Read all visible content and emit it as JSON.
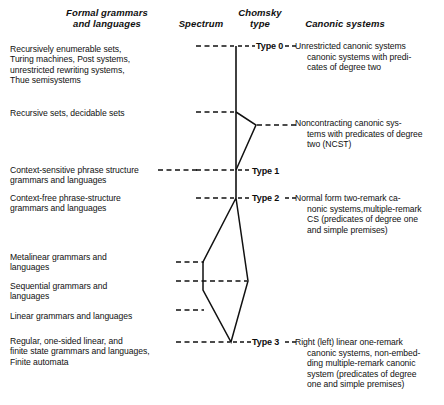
{
  "headers": {
    "formal": "Formal grammars\nand languages",
    "formal_l1": "Formal grammars",
    "formal_l2": "and languages",
    "spectrum": "Spectrum",
    "chomsky_l1": "Chomsky",
    "chomsky_l2": "type",
    "canonic": "Canonic systems"
  },
  "rows": [
    {
      "id": "type0",
      "chomsky": "Type 0",
      "left_lines": [
        "Recursively enumerable sets,",
        "Turing machines, Post systems,",
        "unrestricted rewriting systems,",
        "Thue semisystems"
      ],
      "right_lines": [
        "Unrestricted  canonic  systems",
        "canonic  systems  with  predi-",
        "cates of degree two"
      ]
    },
    {
      "id": "recursive",
      "chomsky": "",
      "left_lines": [
        "Recursive sets, decidable sets"
      ],
      "right_lines": [
        "Noncontracting  canonic  sys-",
        "tems with predicates of degree",
        "two (NCST)"
      ]
    },
    {
      "id": "type1",
      "chomsky": "Type 1",
      "left_lines": [
        "Context-sensitive phrase structure",
        "grammars and languages"
      ],
      "right_lines": []
    },
    {
      "id": "type2",
      "chomsky": "Type 2",
      "left_lines": [
        "Context-free phrase-structure",
        "grammars and languages"
      ],
      "right_lines": [
        "Normal  form  two-remark  ca-",
        "nonic systems,multiple-remark",
        "CS  (predicates  of  degree  one",
        "and simple premises)"
      ]
    },
    {
      "id": "metalinear",
      "chomsky": "",
      "left_lines": [
        "Metalinear grammars and",
        "languages"
      ],
      "right_lines": []
    },
    {
      "id": "sequential",
      "chomsky": "",
      "left_lines": [
        "Sequential grammars and",
        "languages"
      ],
      "right_lines": []
    },
    {
      "id": "linear",
      "chomsky": "",
      "left_lines": [
        "Linear grammars and languages"
      ],
      "right_lines": []
    },
    {
      "id": "type3",
      "chomsky": "Type 3",
      "left_lines": [
        "Regular, one-sided linear, and",
        "finite state grammars and languages,",
        "Finite automata"
      ],
      "right_lines": [
        "Right  (left)  linear  one-remark",
        "canonic  systems,  non-embed-",
        "ding  multiple-remark  canonic",
        "system  (predicates  of  degree",
        "one and simple premises)"
      ]
    }
  ],
  "colors": {
    "ink": "#101010",
    "line": "#111111"
  }
}
